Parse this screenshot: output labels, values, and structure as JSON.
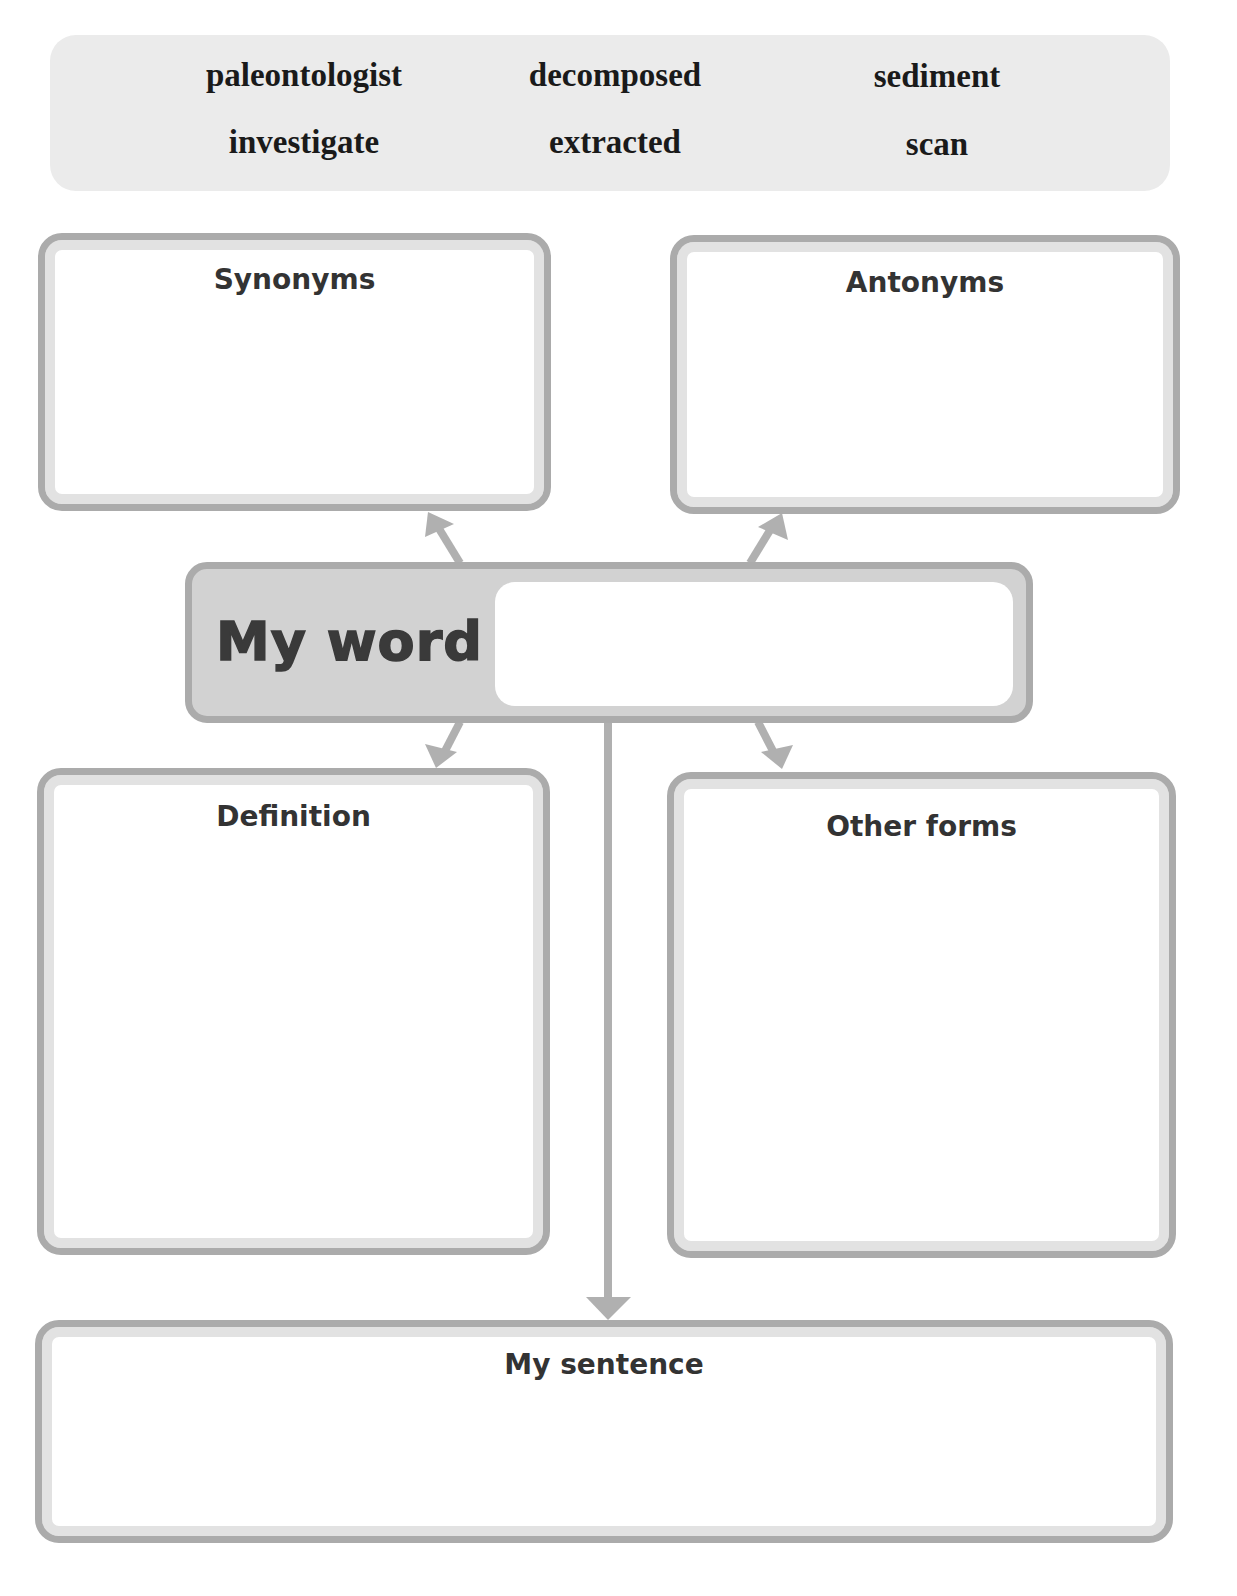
{
  "word_bank": {
    "words": [
      [
        "paleontologist",
        "decomposed",
        "sediment"
      ],
      [
        "investigate",
        "extracted",
        "scan"
      ]
    ]
  },
  "boxes": {
    "synonyms": {
      "title": "Synonyms",
      "value": ""
    },
    "antonyms": {
      "title": "Antonyms",
      "value": ""
    },
    "definition": {
      "title": "Definition",
      "value": ""
    },
    "other_forms": {
      "title": "Other forms",
      "value": ""
    },
    "my_sentence": {
      "title": "My sentence",
      "value": ""
    }
  },
  "my_word": {
    "label": "My word",
    "value": ""
  },
  "colors": {
    "border": "#ababab",
    "inner_band": "#e2e2e2",
    "word_bank_bg": "#ebebeb",
    "my_word_bg": "#d2d2d2",
    "arrow": "#b0b0b0",
    "heading_text": "#333333"
  },
  "icons": {
    "arrow_up_left": "arrow-up-left-icon",
    "arrow_up_right": "arrow-up-right-icon",
    "arrow_down_left": "arrow-down-left-icon",
    "arrow_down_right": "arrow-down-right-icon",
    "arrow_down": "arrow-down-icon"
  }
}
